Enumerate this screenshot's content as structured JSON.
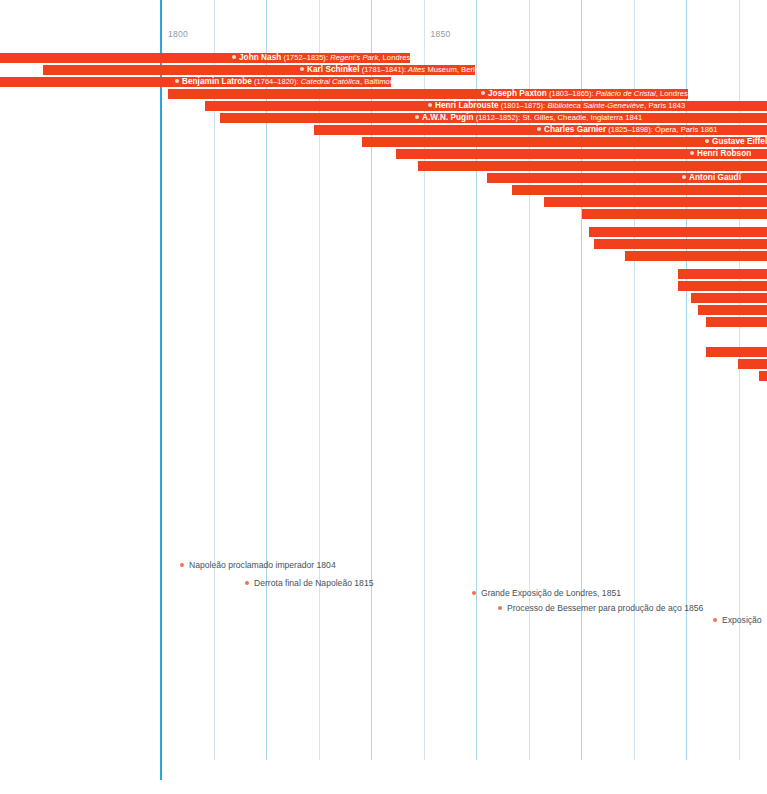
{
  "chart_data": {
    "type": "bar",
    "title": "",
    "xlabel": "",
    "ylabel": "",
    "orientation": "horizontal-gantt-timeline",
    "xlim": [
      1769,
      1930
    ],
    "grid": true,
    "axis": {
      "ticks": [
        {
          "label": "1800",
          "year": 1800
        },
        {
          "label": "1850",
          "year": 1850
        }
      ],
      "gridline_years": [
        1800,
        1810,
        1820,
        1830,
        1840,
        1850,
        1860,
        1870,
        1880,
        1890,
        1900,
        1910
      ]
    },
    "colors": {
      "bar": "#f0411c",
      "major_gridline": "#2ba6dd",
      "minor_gridline": "#a9d6ea",
      "event_dot": "#f2734e",
      "bar_label_text": "#ffffff",
      "event_text": "#45525c",
      "axis_text": "#8d9aa3",
      "background": "#ffffff"
    },
    "categories": [
      "John Nash",
      "Karl Schinkel",
      "Benjamin Latrobe",
      "Joseph Paxton",
      "Henri Labrouste",
      "A.W.N. Pugin",
      "Charles Garnier",
      "Gustave Eiffel",
      "Henri Robson",
      "",
      "Antoni Gaudí",
      "",
      "",
      "",
      "",
      "",
      "",
      "",
      "",
      "",
      "",
      "",
      "",
      "",
      ""
    ],
    "series": [
      {
        "name": "lifespan",
        "unit": "year"
      }
    ],
    "bars": [
      {
        "start": 1752,
        "end": 1835,
        "x": 0,
        "w": 410,
        "y": 53
      },
      {
        "start": 1781,
        "end": 1841,
        "x": 43,
        "w": 432,
        "y": 65
      },
      {
        "start": 1764,
        "end": 1820,
        "x": 0,
        "w": 391,
        "y": 77
      },
      {
        "start": 1803,
        "end": 1865,
        "x": 168,
        "w": 520,
        "y": 89
      },
      {
        "start": 1801,
        "end": 1875,
        "x": 205,
        "w": 562,
        "y": 101
      },
      {
        "start": 1812,
        "end": 1852,
        "x": 220,
        "w": 547,
        "y": 113
      },
      {
        "start": 1825,
        "end": 1898,
        "x": 314,
        "w": 453,
        "y": 125
      },
      {
        "start": 1832,
        "end": 1923,
        "x": 362,
        "w": 405,
        "y": 137
      },
      {
        "start": 1835,
        "end": 1917,
        "x": 396,
        "w": 371,
        "y": 149
      },
      {
        "start": 1843,
        "end": 1930,
        "x": 418,
        "w": 349,
        "y": 161
      },
      {
        "start": 1852,
        "end": 1926,
        "x": 487,
        "w": 280,
        "y": 173
      },
      {
        "start": 1856,
        "end": 1934,
        "x": 512,
        "w": 255,
        "y": 185
      },
      {
        "start": 1861,
        "end": 1938,
        "x": 544,
        "w": 223,
        "y": 197
      },
      {
        "start": 1868,
        "end": 1940,
        "x": 582,
        "w": 185,
        "y": 209
      },
      {
        "start": 1870,
        "end": 1945,
        "x": 589,
        "w": 178,
        "y": 227
      },
      {
        "start": 1871,
        "end": 1946,
        "x": 594,
        "w": 173,
        "y": 239
      },
      {
        "start": 1878,
        "end": 1950,
        "x": 625,
        "w": 142,
        "y": 251
      },
      {
        "start": 1885,
        "end": 1955,
        "x": 678,
        "w": 89,
        "y": 269
      },
      {
        "start": 1886,
        "end": 1957,
        "x": 678,
        "w": 89,
        "y": 281
      },
      {
        "start": 1890,
        "end": 1960,
        "x": 691,
        "w": 76,
        "y": 293
      },
      {
        "start": 1892,
        "end": 1962,
        "x": 698,
        "w": 69,
        "y": 305
      },
      {
        "start": 1895,
        "end": 1965,
        "x": 706,
        "w": 61,
        "y": 317
      },
      {
        "start": 1904,
        "end": 1970,
        "x": 706,
        "w": 61,
        "y": 347
      },
      {
        "start": 1910,
        "end": 1975,
        "x": 738,
        "w": 29,
        "y": 359
      },
      {
        "start": 1916,
        "end": 1980,
        "x": 759,
        "w": 8,
        "y": 371
      }
    ],
    "bar_labels": [
      {
        "row": 0,
        "x": 232,
        "name": "John Nash",
        "dates": "(1752–1835):",
        "work": "Regent's Park",
        "tail": ", Londres 1812"
      },
      {
        "row": 1,
        "x": 300,
        "name": "Karl Schinkel",
        "dates": "(1781–1841):",
        "work": "Altes",
        "tail": " Museum, Berlim 1823"
      },
      {
        "row": 2,
        "x": 175,
        "name": "Benjamin Latrobe",
        "dates": "(1764–1820):",
        "work": "Catedral Católica",
        "tail": ", Baltimore 1805"
      },
      {
        "row": 3,
        "x": 481,
        "name": "Joseph Paxton",
        "dates": "(1803–1865):",
        "work": "Palácio de Cristal",
        "tail": ", Londres 1851"
      },
      {
        "row": 4,
        "x": 428,
        "name": "Henri Labrouste",
        "dates": "(1801–1875):",
        "work": "Biblioteca Sainte-Geneviève",
        "tail": ", Paris 1843"
      },
      {
        "row": 5,
        "x": 415,
        "name": "A.W.N. Pugin",
        "dates": "(1812–1852):",
        "work": "",
        "tail": " St. Gilles, Cheadle, Inglaterra 1841"
      },
      {
        "row": 6,
        "x": 537,
        "name": "Charles Garnier",
        "dates": "(1825–1898):",
        "work": "",
        "tail": " Ópera, Paris 1861"
      },
      {
        "row": 7,
        "x": 705,
        "name": "Gustave Eiffel",
        "dates": "",
        "work": "",
        "tail": ""
      },
      {
        "row": 8,
        "x": 690,
        "name": "Henri Robson",
        "dates": "",
        "work": "",
        "tail": ""
      },
      {
        "row": 10,
        "x": 682,
        "name": "Antoni Gaudí",
        "dates": "",
        "work": "",
        "tail": ""
      }
    ],
    "events": [
      {
        "label": "Napoleão proclamado imperador 1804",
        "year": 1804,
        "x": 180,
        "y": 560
      },
      {
        "label": "Derrota final de Napoleão 1815",
        "year": 1815,
        "x": 245,
        "y": 578
      },
      {
        "label": "Grande Exposição de Londres, 1851",
        "year": 1851,
        "x": 472,
        "y": 588
      },
      {
        "label": "Processo de Bessemer para produção de aço 1856",
        "year": 1856,
        "x": 498,
        "y": 603
      },
      {
        "label": "Exposição",
        "year": 1900,
        "x": 713,
        "y": 615
      }
    ]
  }
}
